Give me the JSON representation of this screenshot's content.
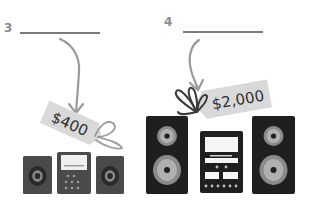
{
  "items": [
    {
      "number": "3",
      "price_tag": "$400",
      "product": "small-stereo-system",
      "answer_blank": ""
    },
    {
      "number": "4",
      "price_tag": "$2,000",
      "product": "large-stereo-system",
      "answer_blank": ""
    }
  ],
  "colors": {
    "tag_fill": "#d9d9d9",
    "arrow": "#9a9a9a",
    "line": "#7a7a7a",
    "speaker_small": "#4a4a4a",
    "speaker_large": "#1f1f1f",
    "cone_ring": "#8a8a8a"
  }
}
